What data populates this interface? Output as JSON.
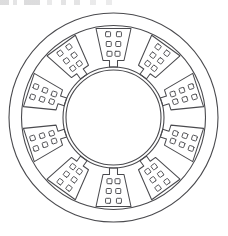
{
  "figure": {
    "kind": "technical-line-drawing",
    "background_color": "#ffffff",
    "line_color": "#4a4a4e",
    "canvas": {
      "width": 228,
      "height": 236
    }
  },
  "geometry": {
    "center": {
      "x": 113.5,
      "y": 117.5
    },
    "outer_housing_radius": 104.5,
    "stator_yoke_outer_radius": 92.0,
    "bore_outer_radius": 50.5,
    "bore_inner_radius": 47.5,
    "slot_count": 10,
    "slot_pitch_degrees": 36,
    "first_slot_angle_degrees": 90,
    "slot_angles_degrees": [
      90,
      126,
      162,
      198,
      234,
      270,
      306,
      342,
      18,
      54
    ],
    "conductors_per_slot": 6,
    "conductor_grid_rows": 3,
    "conductor_grid_columns": 2,
    "slot_outer_radius": 89.0,
    "slot_inner_radius": 57.0,
    "slot_outer_half_width": 17.5,
    "slot_inner_half_width": 10.5,
    "slot_neck_half_width": 4.0,
    "slot_neck_inner_radius": 50.5
  },
  "circles": [
    {
      "name": "outer-housing-circle",
      "radius": 104.5,
      "stroke_width": 1.1
    },
    {
      "name": "stator-yoke-circle",
      "radius": 92.0,
      "stroke_width": 1.1
    },
    {
      "name": "bore-outer-circle",
      "radius": 50.5,
      "stroke_width": 1.1
    },
    {
      "name": "bore-inner-circle",
      "radius": 47.5,
      "stroke_width": 1.1
    }
  ],
  "artifact": {
    "name": "top-edge-scan-artifact",
    "description": "faint grey speckle band at the top edge of the scan"
  }
}
